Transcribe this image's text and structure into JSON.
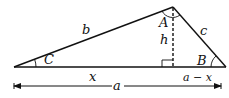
{
  "diagram": {
    "vertices": {
      "C": {
        "label": "C",
        "x": 14,
        "y": 67
      },
      "A": {
        "label": "A",
        "x": 173,
        "y": 7
      },
      "B": {
        "label": "B",
        "x": 226,
        "y": 67
      }
    },
    "sides": {
      "b": "b",
      "c": "c"
    },
    "altitude": {
      "label": "h",
      "style": "dashed"
    },
    "segments": {
      "x": "x",
      "a_minus_x": "a − x",
      "a": "a"
    },
    "colors": {
      "stroke": "#111111",
      "background": "#ffffff"
    }
  }
}
